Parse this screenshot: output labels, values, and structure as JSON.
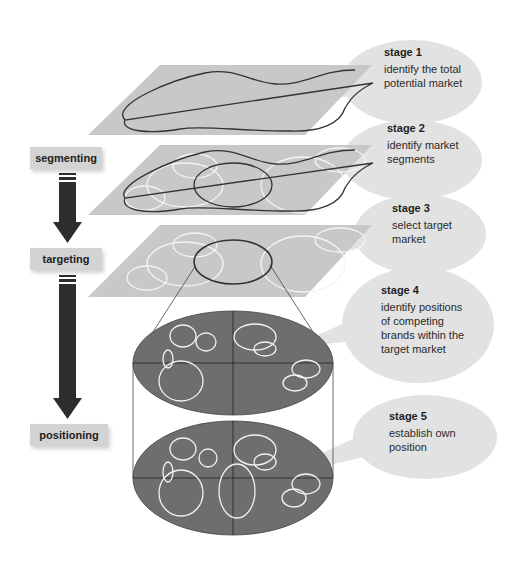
{
  "diagram": {
    "title": "",
    "colors": {
      "plane": "#c8c8c8",
      "bubble": "#e2e2e2",
      "outline": "#333333",
      "segment_rings": "#f4f4f4",
      "cylinder_fill": "#6e6e6e",
      "arrow": "#2e2e2e",
      "label_box": "#d3d3d3"
    },
    "process_steps": [
      {
        "label": "segmenting"
      },
      {
        "label": "targeting"
      },
      {
        "label": "positioning"
      }
    ],
    "stages": [
      {
        "title": "stage 1",
        "text": "identify the total\npotential market"
      },
      {
        "title": "stage 2",
        "text": "identify market\nsegments"
      },
      {
        "title": "stage 3",
        "text": "select target\nmarket"
      },
      {
        "title": "stage 4",
        "text": "identify positions\nof competing\nbrands within the\ntarget market"
      },
      {
        "title": "stage 5",
        "text": "establish own\nposition"
      }
    ]
  }
}
